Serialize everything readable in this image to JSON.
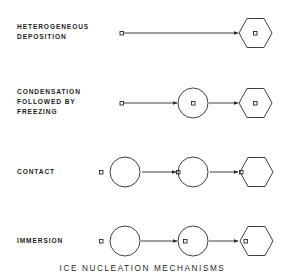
{
  "title": "ICE NUCLEATION MECHANISMS",
  "mechanisms": [
    {
      "lines": [
        "HETEROGENEOUS",
        "DEPOSITION"
      ],
      "name": "heterogeneous-deposition",
      "sequence": [
        "particle",
        "ice-crystal-with-particle"
      ]
    },
    {
      "lines": [
        "CONDENSATION",
        "FOLLOWED BY",
        "FREEZING"
      ],
      "name": "condensation-freezing",
      "sequence": [
        "particle",
        "droplet-with-particle",
        "ice-crystal-with-particle"
      ]
    },
    {
      "lines": [
        "CONTACT"
      ],
      "name": "contact",
      "sequence": [
        "particle-beside-droplet",
        "particle-touching-droplet",
        "ice-crystal-with-particle-at-edge"
      ]
    },
    {
      "lines": [
        "IMMERSION"
      ],
      "name": "immersion",
      "sequence": [
        "particle-beside-droplet",
        "droplet-with-particle-inside",
        "ice-crystal-with-particle-inside"
      ]
    }
  ],
  "colors": {
    "stroke": "#2a2a2a",
    "background": "#ffffff"
  }
}
